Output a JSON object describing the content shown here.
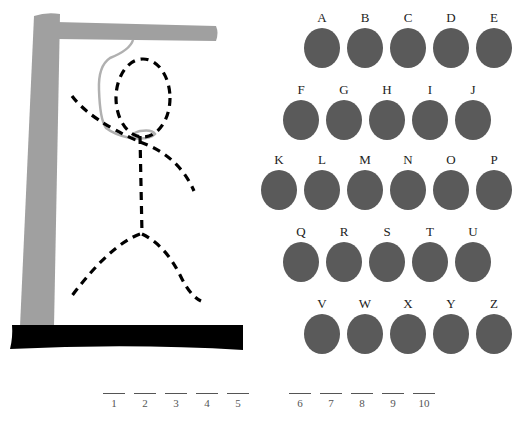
{
  "game": "Hangman",
  "colors": {
    "gallows": "#a0a0a0",
    "base": "#000000",
    "rope": "#b0b0b0",
    "figure": "#000000",
    "letter_disc": "#5a5a5a",
    "letter_text": "#222222"
  },
  "letter_rows": [
    {
      "x": 304,
      "y": 10,
      "letters": [
        "A",
        "B",
        "C",
        "D",
        "E"
      ]
    },
    {
      "x": 283,
      "y": 82,
      "letters": [
        "F",
        "G",
        "H",
        "I",
        "J"
      ]
    },
    {
      "x": 261,
      "y": 152,
      "letters": [
        "K",
        "L",
        "M",
        "N",
        "O",
        "P"
      ]
    },
    {
      "x": 283,
      "y": 224,
      "letters": [
        "Q",
        "R",
        "S",
        "T",
        "U"
      ]
    },
    {
      "x": 304,
      "y": 296,
      "letters": [
        "V",
        "W",
        "X",
        "Y",
        "Z"
      ]
    }
  ],
  "letters": {
    "A": "A",
    "B": "B",
    "C": "C",
    "D": "D",
    "E": "E",
    "F": "F",
    "G": "G",
    "H": "H",
    "I": "I",
    "J": "J",
    "K": "K",
    "L": "L",
    "M": "M",
    "N": "N",
    "O": "O",
    "P": "P",
    "Q": "Q",
    "R": "R",
    "S": "S",
    "T": "T",
    "U": "U",
    "V": "V",
    "W": "W",
    "X": "X",
    "Y": "Y",
    "Z": "Z"
  },
  "word_blanks": {
    "count": 10,
    "labels": [
      "1",
      "2",
      "3",
      "4",
      "5",
      "6",
      "7",
      "8",
      "9",
      "10"
    ]
  },
  "figure_parts": [
    "head",
    "body",
    "left-arm",
    "right-arm",
    "left-leg",
    "right-leg",
    "rope"
  ]
}
